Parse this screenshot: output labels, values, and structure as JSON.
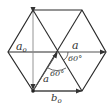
{
  "diagram": {
    "type": "hexagonal-lattice-vectors",
    "colors": {
      "line": "#2a2a2a",
      "vector": "#555555",
      "background": "#ffffff"
    },
    "labels": {
      "a0_vertical": "a",
      "a0_sub": "o",
      "a_horizontal": "a",
      "a_diagonal": "a",
      "b0": "b",
      "b0_sub": "o",
      "angle_upper": "60°",
      "angle_lower": "60°"
    }
  }
}
